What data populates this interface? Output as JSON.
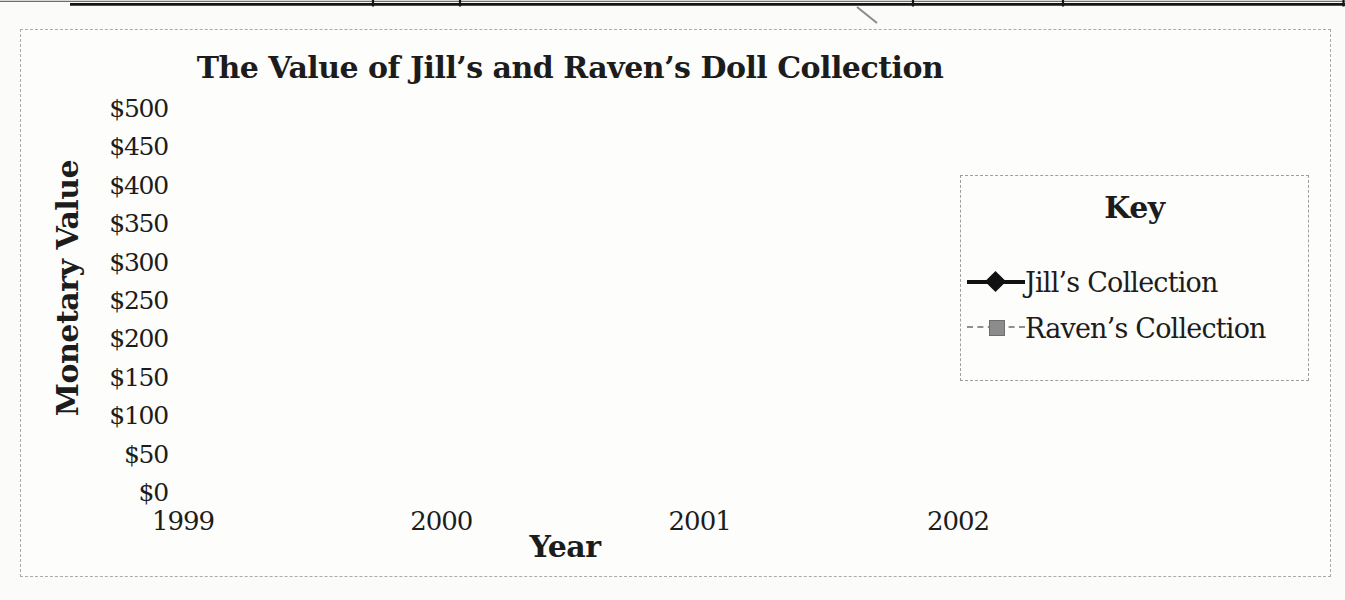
{
  "chart_data": {
    "type": "line",
    "title": "The Value of Jill’s and Raven’s Doll Collection",
    "xlabel": "Year",
    "ylabel": "Monetary Value",
    "categories": [
      "1999",
      "2000",
      "2001",
      "2002"
    ],
    "series": [
      {
        "name": "Jill’s Collection",
        "values": [
          150,
          210,
          320,
          480
        ],
        "color": "#111111",
        "marker": "diamond",
        "line_style": "solid",
        "line_width": 4
      },
      {
        "name": "Raven’s Collection",
        "values": [
          320,
          390,
          415,
          440
        ],
        "color": "#8c8c8c",
        "marker": "square",
        "line_style": "dash-dot",
        "line_width": 2
      }
    ],
    "ylim": [
      0,
      500
    ],
    "y_tick_step": 50,
    "y_tick_labels": [
      "$0",
      "$50",
      "$100",
      "$150",
      "$200",
      "$250",
      "$300",
      "$350",
      "$400",
      "$450",
      "$500"
    ],
    "grid": "both",
    "legend": {
      "title": "Key",
      "position": "right",
      "entries": [
        "Jill’s Collection",
        "Raven’s Collection"
      ]
    }
  }
}
